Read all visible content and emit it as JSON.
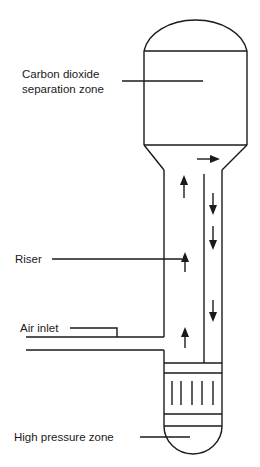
{
  "diagram": {
    "type": "airlift-loop-reactor-schematic",
    "labels": {
      "co2_zone_line1": "Carbon dioxide",
      "co2_zone_line2": "separation zone",
      "riser": "Riser",
      "air_inlet": "Air inlet",
      "high_pressure_zone": "High pressure zone"
    },
    "flow_arrows": [
      {
        "direction": "up",
        "location": "riser"
      },
      {
        "direction": "up",
        "location": "riser"
      },
      {
        "direction": "up",
        "location": "riser"
      },
      {
        "direction": "up",
        "location": "riser"
      },
      {
        "direction": "right",
        "location": "top-crossover"
      },
      {
        "direction": "down",
        "location": "downcomer"
      },
      {
        "direction": "down",
        "location": "downcomer"
      },
      {
        "direction": "down",
        "location": "downcomer"
      }
    ],
    "colors": {
      "line": "#1a1a1a",
      "background": "#ffffff"
    }
  }
}
